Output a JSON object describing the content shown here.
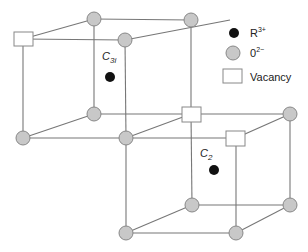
{
  "diagram": {
    "colors": {
      "line": "#777777",
      "oxygen_fill": "#c8c8c8",
      "oxygen_stroke": "#888888",
      "cation_fill": "#111111",
      "vacancy_fill": "#ffffff",
      "vacancy_stroke": "#888888"
    },
    "site_labels": {
      "c3i_main": "C",
      "c3i_sub": "3i",
      "c2_main": "C",
      "c2_sub": "2"
    },
    "legend": {
      "cation_label": "R",
      "cation_sup": "3+",
      "oxygen_label": "0",
      "oxygen_sup": "2−",
      "vacancy_label": "Vacancy"
    }
  }
}
